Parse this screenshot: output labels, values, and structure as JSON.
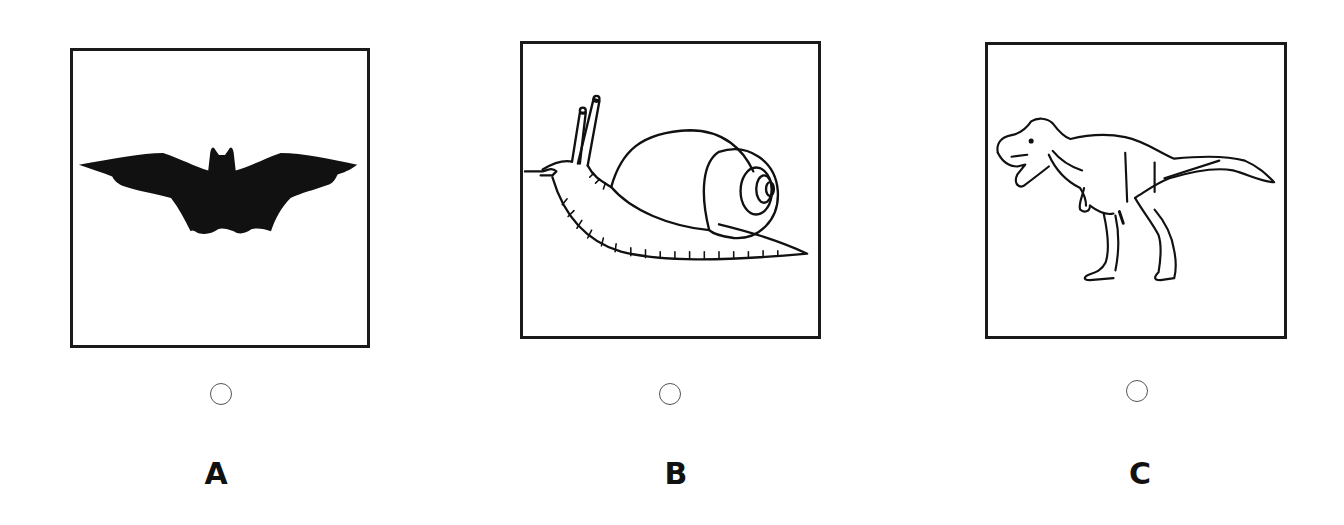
{
  "options": [
    {
      "letter": "A",
      "image": "bat-silhouette",
      "selected": false
    },
    {
      "letter": "B",
      "image": "snail-line-drawing",
      "selected": false
    },
    {
      "letter": "C",
      "image": "tyrannosaurus-line-drawing",
      "selected": false
    }
  ],
  "colors": {
    "stroke": "#1a1a1a",
    "background": "#ffffff",
    "radio_border": "#555555"
  }
}
